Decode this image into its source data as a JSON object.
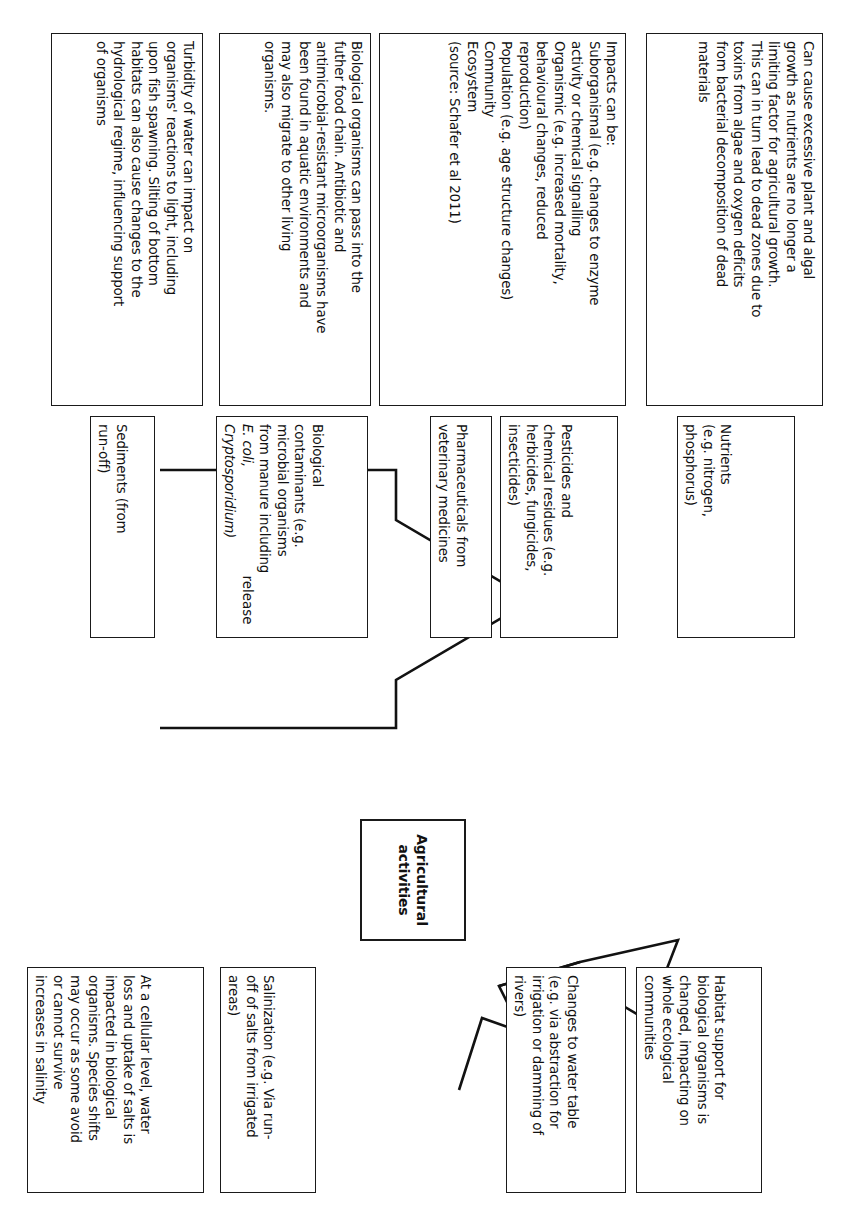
{
  "diagram": {
    "center_node": {
      "label": "Agricultural\nactivities",
      "label_line1": "Agricultural",
      "label_line2": "activities"
    },
    "arrows": {
      "release_label": "release",
      "can_lead_to_label_line1": "Can",
      "can_lead_to_label_line2": "lead",
      "can_lead_to_label_line3": "to"
    },
    "release_columns": [
      {
        "id": "nutrients",
        "source": {
          "lines": [
            "Nutrients",
            "(e.g. nitrogen,",
            "phosphorus)"
          ]
        },
        "impact": {
          "lines": [
            "Can cause excessive plant and algal",
            "growth as nutrients are no longer a",
            "limiting factor for agricultural growth.",
            "This can in turn lead to dead zones due to",
            "toxins from algae and oxygen deficits",
            "from bacterial decomposition of dead",
            "materials"
          ]
        }
      },
      {
        "id": "pesticides",
        "source": {
          "lines": [
            "Pesticides and",
            "chemical residues (e.g.",
            "herbicides, fungicides,",
            "insecticides)"
          ]
        },
        "source2": {
          "lines": [
            "Pharmaceuticals from",
            "veterinary medicines"
          ]
        },
        "impact": {
          "lines": [
            "Impacts can be:",
            "Suborganismal (e.g. changes to enzyme",
            "activity or chemical signalling",
            "Organismic (e.g. increased mortality,",
            "behavioural changes, reduced",
            "reproduction)",
            "Population (e.g. age structure changes)",
            "Community",
            "Ecosystem",
            "(source: Schafer et al 2011)"
          ]
        }
      },
      {
        "id": "biological-contaminants",
        "source": {
          "lines": [
            "Biological",
            "contaminants (e.g.",
            "microbial organisms",
            "from manure including",
            "E. coli,",
            "Cryptosporidium)"
          ],
          "italic_lines": [
            "E. coli,",
            "Cryptosporidium)"
          ]
        },
        "impact": {
          "lines": [
            "Biological organisms can pass into the",
            "futher food chain. Antibiotic and",
            "antimicrobial-resistant microorganisms have",
            "been found in aquatic environments and",
            "may also migrate to other living",
            "organisms."
          ]
        }
      },
      {
        "id": "sediments",
        "source": {
          "lines": [
            "Sediments (from",
            "run-off)"
          ]
        },
        "impact": {
          "lines": [
            "Turbidity of water can impact on",
            "organisms' reactions to light, including",
            "upon fish spawning. Silting of bottom",
            "habitats can also cause changes to the",
            "hydrological regime, influencing support",
            "of organisms"
          ]
        }
      }
    ],
    "lead_to_nodes": [
      {
        "id": "habitat-support",
        "lines": [
          "Habitat support for",
          "biological organisms is",
          "changed, impacting on",
          "whole ecological",
          "communities"
        ]
      },
      {
        "id": "water-table",
        "lines": [
          "Changes to water table",
          "(e.g. via abstraction for",
          "irrigation or damming of",
          "rivers)"
        ]
      },
      {
        "id": "salinization",
        "lines": [
          "Salinization (e.g. Via run-",
          "off of salts from irrigated",
          "areas)"
        ]
      },
      {
        "id": "salinity-impact",
        "lines": [
          "At a cellular level, water",
          "loss and uptake of salts is",
          "impacted in biological",
          "organisms. Species shifts",
          "may occur as some avoid",
          "or cannot survive",
          "increases in salinity"
        ]
      }
    ],
    "colors": {
      "stroke": "#121212",
      "text": "#111111",
      "background": "#ffffff"
    }
  }
}
